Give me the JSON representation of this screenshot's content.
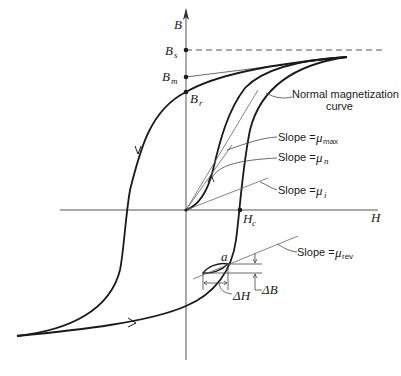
{
  "figure": {
    "axes": {
      "vertical_label": "B",
      "horizontal_label": "H"
    },
    "points": {
      "saturation": {
        "label": "B",
        "sub": "s"
      },
      "max": {
        "label": "B",
        "sub": "m"
      },
      "remanence": {
        "label": "B",
        "sub": "r"
      },
      "coercive": {
        "label": "H",
        "sub": "c"
      },
      "minor_loop_point": {
        "label": "a"
      }
    },
    "annotations": {
      "normal_curve_line1": "Normal magnetization",
      "normal_curve_line2": "curve",
      "slope_max": {
        "text": "Slope = ",
        "mu": "μ",
        "sub": "max"
      },
      "slope_n": {
        "text": "Slope = ",
        "mu": "μ",
        "sub": "n"
      },
      "slope_i": {
        "text": "Slope = ",
        "mu": "μ",
        "sub": "i"
      },
      "slope_rev": {
        "text": "Slope = ",
        "mu": "μ",
        "sub": "rev"
      },
      "delta_h": "ΔH",
      "delta_b": "ΔB"
    },
    "colors": {
      "curve": "#1a1a1a",
      "axis": "#555555",
      "thin": "#666666"
    }
  }
}
